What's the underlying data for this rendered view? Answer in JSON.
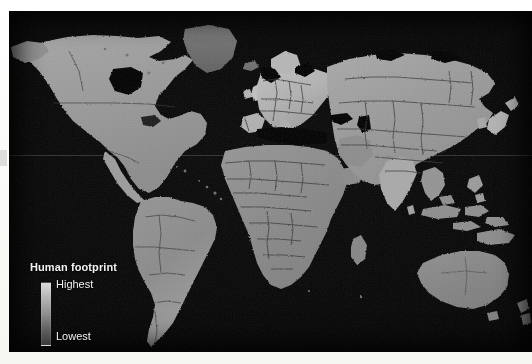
{
  "figure": {
    "type": "world-map",
    "projection_note": "equirectangular world map, grayscale raster",
    "background_color": "#000000",
    "paper_color": "#ffffff"
  },
  "legend": {
    "title": "Human footprint",
    "high_label": "Highest",
    "low_label": "Lowest",
    "gradient_high_color": "#dcdcdc",
    "gradient_low_color": "#3a3a3a"
  },
  "map": {
    "ocean_color": "#000000",
    "land_base_color": "#8e8e8e",
    "border_color": "#2a2a2a",
    "regions": [
      {
        "name": "north-america",
        "label": "North America",
        "tone": "#9a9a9a"
      },
      {
        "name": "greenland",
        "label": "Greenland",
        "tone": "#6f6f6f"
      },
      {
        "name": "south-america",
        "label": "South America",
        "tone": "#8d8d8d"
      },
      {
        "name": "europe",
        "label": "Europe",
        "tone": "#b4b4b4"
      },
      {
        "name": "africa",
        "label": "Africa",
        "tone": "#8a8a8a"
      },
      {
        "name": "asia",
        "label": "Asia",
        "tone": "#9b9b9b"
      },
      {
        "name": "india",
        "label": "India",
        "tone": "#a8a8a8"
      },
      {
        "name": "southeast-asia",
        "label": "Southeast Asia",
        "tone": "#8f8f8f"
      },
      {
        "name": "australia",
        "label": "Australia",
        "tone": "#868686"
      },
      {
        "name": "new-zealand",
        "label": "New Zealand",
        "tone": "#8a8a8a"
      },
      {
        "name": "japan",
        "label": "Japan",
        "tone": "#b0b0b0"
      },
      {
        "name": "madagascar",
        "label": "Madagascar",
        "tone": "#858585"
      },
      {
        "name": "british-isles",
        "label": "British Isles",
        "tone": "#bcbcbc"
      },
      {
        "name": "iceland",
        "label": "Iceland",
        "tone": "#6a6a6a"
      }
    ]
  }
}
